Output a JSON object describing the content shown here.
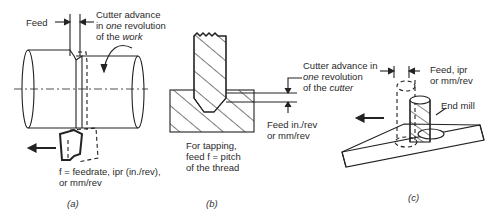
{
  "panels": [
    {
      "id": "a",
      "caption": "(a)",
      "labels": {
        "feed": "Feed",
        "advance_line1": "Cutter advance",
        "advance_line2_pre": "in ",
        "advance_line2_em": "one",
        "advance_line2_post": " revolution",
        "advance_line3_pre": "of the ",
        "advance_line3_em": "work",
        "feedrate_line1": "f = feedrate, ipr (in./rev),",
        "feedrate_line2": "or mm/rev"
      }
    },
    {
      "id": "b",
      "caption": "(b)",
      "labels": {
        "feed_line1": "Feed in./rev",
        "feed_line2": "or mm/rev",
        "tap_line1": "For tapping,",
        "tap_line2": "feed f = pitch",
        "tap_line3": "of the thread"
      }
    },
    {
      "id": "c",
      "caption": "(c)",
      "labels": {
        "advance_line1": "Cutter advance in",
        "advance_line2_em": "one",
        "advance_line2_post": " revolution",
        "advance_line3_pre": "of the ",
        "advance_line3_em": "cutter",
        "feed_line1": "Feed, ipr",
        "feed_line2": "or mm/rev",
        "end_mill": "End mill"
      }
    }
  ]
}
